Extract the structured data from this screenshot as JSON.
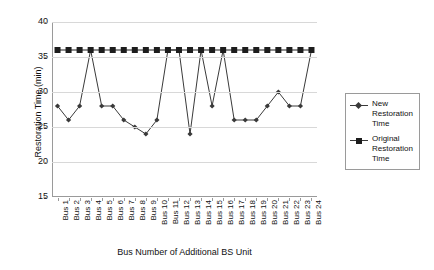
{
  "chart_data": {
    "type": "line",
    "title": "",
    "xlabel": "Bus Number of Additional BS Unit",
    "ylabel": "Restoration Time (min)",
    "ylim": [
      15,
      40
    ],
    "ytick_step": 5,
    "yticks": [
      40,
      35,
      30,
      25,
      20,
      15
    ],
    "grid": true,
    "legend_position": "right",
    "categories": [
      "Bus 1",
      "Bus 2",
      "Bus 3",
      "Bus 4",
      "Bus 5",
      "Bus 6",
      "Bus 7",
      "Bus 8",
      "Bus 9",
      "Bus 10",
      "Bus 11",
      "Bus 12",
      "Bus 13",
      "Bus 14",
      "Bus 15",
      "Bus 16",
      "Bus 17",
      "Bus 18",
      "Bus 19",
      "Bus 20",
      "Bus 21",
      "Bus 22",
      "Bus 23",
      "Bus 24"
    ],
    "series": [
      {
        "name": "New Restoration Time",
        "marker": "diamond",
        "color": "#3a3a3a",
        "values": [
          28,
          26,
          28,
          36,
          28,
          28,
          26,
          25,
          24,
          26,
          36,
          36,
          24,
          36,
          28,
          36,
          26,
          26,
          26,
          28,
          30,
          28,
          28,
          36
        ]
      },
      {
        "name": "Original Restoration Time",
        "marker": "square",
        "color": "#1d1d1d",
        "values": [
          36,
          36,
          36,
          36,
          36,
          36,
          36,
          36,
          36,
          36,
          36,
          36,
          36,
          36,
          36,
          36,
          36,
          36,
          36,
          36,
          36,
          36,
          36,
          36
        ]
      }
    ]
  },
  "legend": {
    "items": [
      {
        "label": "New Restoration Time"
      },
      {
        "label": "Original Restoration Time"
      }
    ]
  }
}
